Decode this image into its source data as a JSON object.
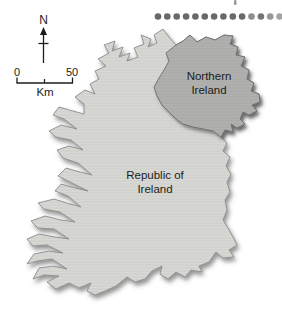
{
  "figure": {
    "type": "map-figure"
  },
  "map": {
    "regions": [
      {
        "name": "Republic of Ireland",
        "label_line1": "Republic of",
        "label_line2": "Ireland",
        "fill": "#d8d8d4"
      },
      {
        "name": "Northern Ireland",
        "label_line1": "Northern",
        "label_line2": "Ireland",
        "fill": "#b1b1af"
      }
    ],
    "coast_stroke": "#8c8c8c",
    "border_stroke": "#6f6f6f"
  },
  "compass": {
    "label": "N",
    "arrow_icon": "north-arrow"
  },
  "scalebar": {
    "start_value": "0",
    "end_value": "50",
    "unit": "Km"
  },
  "dots": {
    "count": 14,
    "colors": [
      "#696969",
      "#696969",
      "#696969",
      "#696969",
      "#696969",
      "#696969",
      "#696969",
      "#696969",
      "#696969",
      "#696969",
      "#8e8e8e",
      "#757575",
      "#979797",
      "#a3a3a3"
    ]
  },
  "cropped_mark": {
    "color": "#9a9a9a"
  },
  "colors": {
    "background": "#ffffff",
    "text": "#1c1c1c",
    "shadow": "#3c3c3c"
  }
}
